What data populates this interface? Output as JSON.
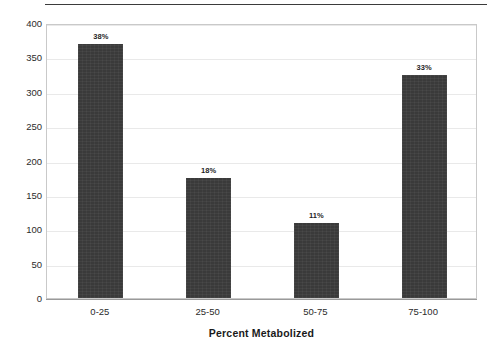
{
  "chart_data": {
    "type": "bar",
    "title": "",
    "categories": [
      "0-25",
      "25-50",
      "50-75",
      "75-100"
    ],
    "values": [
      369,
      175,
      109,
      324
    ],
    "data_labels": [
      "38%",
      "18%",
      "11%",
      "33%"
    ],
    "xlabel": "Percent Metabolized",
    "ylabel": "Number of Compounds",
    "ylim": [
      0,
      400
    ],
    "yticks": [
      400,
      350,
      300,
      250,
      200,
      150,
      100,
      50,
      0
    ],
    "ytick_labels": [
      "400",
      "350",
      "300",
      "250",
      "200",
      "150",
      "100",
      "50",
      "0"
    ],
    "grid": true,
    "grid_axis": "y",
    "legend": false,
    "bar_color": "#3a3a3a",
    "gridline_color": "#e9e9e9",
    "axis_color": "#9a9a9a",
    "text_color": "#1a1a1a"
  },
  "decorations": {
    "top_rule_color": "#3b3b3b"
  }
}
